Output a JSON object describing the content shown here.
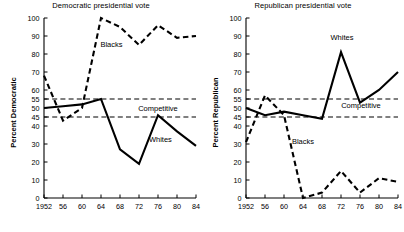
{
  "figure": {
    "panels": [
      {
        "id": "democratic",
        "title": "Democratic presidential vote",
        "ylabel": "Percent Democratic",
        "annotations": [
          {
            "name": "blacks-label",
            "text": "Blacks",
            "x": 1966.2,
            "y": 84
          },
          {
            "name": "whites-label",
            "text": "Whites",
            "x": 1976.5,
            "y": 31
          },
          {
            "name": "competitive-label",
            "text": "Competitive",
            "x": 1976.0,
            "y": 48.5
          }
        ]
      },
      {
        "id": "republican",
        "title": "Republican presidential vote",
        "ylabel": "Percent Republican",
        "annotations": [
          {
            "name": "whites-label",
            "text": "Whites",
            "x": 1972.2,
            "y": 88
          },
          {
            "name": "blacks-label",
            "text": "Blacks",
            "x": 1964.0,
            "y": 30
          },
          {
            "name": "competitive-label",
            "text": "Competitive",
            "x": 1976.2,
            "y": 50
          }
        ]
      }
    ]
  },
  "chart_data": [
    {
      "type": "line",
      "title": "Democratic presidential vote",
      "xlabel": "",
      "ylabel": "Percent Democratic",
      "xlim": [
        1952,
        1984
      ],
      "ylim": [
        0,
        100
      ],
      "xticks": [
        1952,
        1956,
        1960,
        1964,
        1968,
        1972,
        1976,
        1980,
        1984
      ],
      "xticklabels": [
        "1952",
        "56",
        "60",
        "64",
        "68",
        "72",
        "76",
        "80",
        "84"
      ],
      "yticks": [
        0,
        10,
        20,
        30,
        40,
        45,
        50,
        55,
        60,
        70,
        80,
        90,
        100
      ],
      "yticklabels": [
        "0",
        "10",
        "20",
        "30",
        "40",
        "45",
        "50",
        "55",
        "60",
        "70",
        "80",
        "90",
        "100"
      ],
      "grid": false,
      "legend": "inline-annotations",
      "x": [
        1952,
        1956,
        1960,
        1964,
        1968,
        1972,
        1976,
        1980,
        1984
      ],
      "series": [
        {
          "name": "Blacks",
          "style": "dashed",
          "values": [
            68,
            43,
            50,
            100,
            95,
            85,
            96,
            89,
            90
          ]
        },
        {
          "name": "Whites",
          "style": "solid",
          "values": [
            50,
            51,
            52,
            55,
            27,
            19,
            46,
            37,
            29
          ]
        }
      ],
      "reference_lines": [
        {
          "name": "competitive-upper",
          "y": 55,
          "style": "dashed"
        },
        {
          "name": "competitive-lower",
          "y": 45,
          "style": "dashed"
        }
      ],
      "band_label": "Competitive"
    },
    {
      "type": "line",
      "title": "Republican presidential vote",
      "xlabel": "",
      "ylabel": "Percent Republican",
      "xlim": [
        1952,
        1984
      ],
      "ylim": [
        0,
        100
      ],
      "xticks": [
        1952,
        1956,
        1960,
        1964,
        1968,
        1972,
        1976,
        1980,
        1984
      ],
      "xticklabels": [
        "1952",
        "56",
        "60",
        "64",
        "68",
        "72",
        "76",
        "80",
        "84"
      ],
      "yticks": [
        0,
        10,
        20,
        30,
        40,
        45,
        50,
        55,
        60,
        70,
        80,
        90,
        100
      ],
      "yticklabels": [
        "0",
        "10",
        "20",
        "30",
        "40",
        "45",
        "50",
        "55",
        "60",
        "70",
        "80",
        "90",
        "100"
      ],
      "grid": false,
      "legend": "inline-annotations",
      "x": [
        1952,
        1956,
        1960,
        1964,
        1968,
        1972,
        1976,
        1980,
        1984
      ],
      "series": [
        {
          "name": "Blacks",
          "style": "dashed",
          "values": [
            31,
            57,
            46,
            0,
            3,
            15,
            3,
            11,
            9
          ]
        },
        {
          "name": "Whites",
          "style": "solid",
          "values": [
            50,
            46,
            48,
            46,
            44,
            81,
            53,
            60,
            70
          ]
        }
      ],
      "reference_lines": [
        {
          "name": "competitive-upper",
          "y": 55,
          "style": "dashed"
        },
        {
          "name": "competitive-lower",
          "y": 45,
          "style": "dashed"
        }
      ],
      "band_label": "Competitive"
    }
  ]
}
